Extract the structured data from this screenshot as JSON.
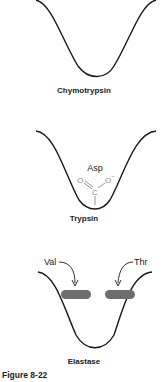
{
  "panels": [
    {
      "enzyme": "Chymotrypsin",
      "pocket_residues": []
    },
    {
      "enzyme": "Trypsin",
      "pocket_residues": [
        "Asp"
      ],
      "group": {
        "c": "C",
        "o_double": "O",
        "o_minus": "O",
        "charge": "−"
      }
    },
    {
      "enzyme": "Elastase",
      "pocket_residues": [
        "Val",
        "Thr"
      ]
    }
  ],
  "figure_label": "Figure 8-22",
  "colors": {
    "line": "#1a1a1a",
    "gray_group": "#8a8a8a",
    "bar": "#6e6e6e"
  }
}
